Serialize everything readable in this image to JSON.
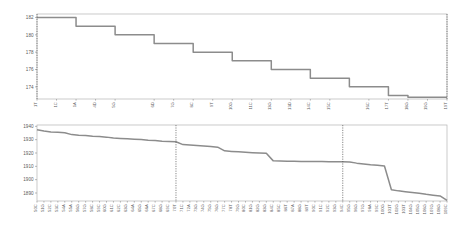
{
  "chart_data": [
    {
      "id": "top",
      "type": "line",
      "title": "",
      "xlabel": "",
      "ylabel": "",
      "drawstyle": "steps-post",
      "grid": false,
      "legend": null,
      "ylim": [
        172.6,
        182.4
      ],
      "yticks": [
        174,
        176,
        178,
        180,
        182
      ],
      "ytick_labels": [
        "174",
        "176",
        "178",
        "180",
        "182"
      ],
      "vertical_markers": [
        1,
        187
      ],
      "x": [
        1,
        10,
        19,
        28,
        37,
        46,
        55,
        64,
        73,
        82,
        91,
        100,
        109,
        118,
        127,
        136,
        145,
        154,
        163,
        172,
        181,
        187
      ],
      "categories": [
        "1T",
        "1C",
        "1A",
        "4D",
        "5G",
        "6D",
        "7G",
        "8C",
        "9T",
        "10G",
        "11C",
        "13G",
        "13D",
        "14C",
        "15C",
        "16C",
        "17T",
        "18G",
        "19G",
        "19T"
      ],
      "values": [
        182,
        182,
        181,
        181,
        180,
        180,
        179,
        179,
        178,
        178,
        177,
        177,
        176,
        176,
        175,
        175,
        174,
        174,
        173,
        172.8,
        172.8,
        172.8
      ]
    },
    {
      "id": "bottom",
      "type": "line",
      "title": "",
      "xlabel": "",
      "ylabel": "",
      "drawstyle": "linear",
      "grid": false,
      "legend": null,
      "ylim": [
        1884,
        1941
      ],
      "yticks": [
        1890,
        1900,
        1910,
        1920,
        1930,
        1940
      ],
      "ytick_labels": [
        "1890",
        "1900",
        "1910",
        "1920",
        "1930",
        "1940"
      ],
      "vertical_markers": [
        20,
        44
      ],
      "categories": [
        "50C",
        "51G",
        "52C",
        "53C",
        "54A",
        "55A",
        "56G",
        "57G",
        "58C",
        "59C",
        "60G",
        "61C",
        "62C",
        "63G",
        "64A",
        "65G",
        "66A",
        "67C",
        "68G",
        "69C",
        "70T",
        "71C",
        "72A",
        "73G",
        "74G",
        "75G",
        "76G",
        "77C",
        "78T",
        "79G",
        "80C",
        "81G",
        "82G",
        "83G",
        "84C",
        "85C",
        "86T",
        "87A",
        "88G",
        "89T",
        "90C",
        "91C",
        "92C",
        "93G",
        "94C",
        "95G",
        "96G",
        "97G",
        "98A",
        "99C",
        "100G",
        "101T",
        "102G",
        "103T",
        "104G",
        "105G",
        "106G",
        "107G",
        "108G",
        "109C"
      ],
      "values": [
        1937.5,
        1936.5,
        1935.8,
        1935.6,
        1935.2,
        1933.8,
        1933.4,
        1933.2,
        1932.6,
        1932.4,
        1931.9,
        1931.2,
        1930.9,
        1930.6,
        1930.4,
        1930.1,
        1929.6,
        1929.4,
        1928.9,
        1928.6,
        1928.4,
        1926.3,
        1926.0,
        1925.6,
        1925.2,
        1924.9,
        1924.4,
        1921.6,
        1921.2,
        1920.9,
        1920.5,
        1920.2,
        1920.0,
        1919.8,
        1914.1,
        1914.0,
        1913.9,
        1913.8,
        1913.7,
        1913.6,
        1913.6,
        1913.6,
        1913.5,
        1913.5,
        1913.4,
        1913.2,
        1912.4,
        1911.8,
        1911.2,
        1910.8,
        1910.2,
        1892.4,
        1891.6,
        1891.0,
        1890.4,
        1889.8,
        1889.0,
        1888.4,
        1887.8,
        1884.4
      ]
    }
  ]
}
